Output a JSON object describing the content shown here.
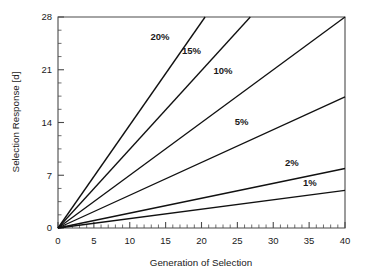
{
  "chart_data": {
    "type": "line",
    "title": "",
    "xlabel": "Generation of Selection",
    "ylabel": "Selection Response [d]",
    "xlim": [
      0,
      40
    ],
    "ylim": [
      0,
      28
    ],
    "grid": false,
    "legend_position": "inline-labels",
    "x_ticks": [
      0,
      5,
      10,
      15,
      20,
      25,
      30,
      35,
      40
    ],
    "x_tick_labels": [
      "0",
      "5",
      "10",
      "15",
      "20",
      "25",
      "30",
      "35",
      "40"
    ],
    "x_minor_tick_step": 1,
    "y_ticks": [
      0,
      7,
      14,
      21,
      28
    ],
    "y_tick_labels": [
      "0",
      "7",
      "14",
      "21",
      "28"
    ],
    "y_minor_tick_step": 1.75,
    "series": [
      {
        "name": "20%",
        "label": "20%",
        "slope": 1.366,
        "x": [
          0,
          20.5
        ],
        "values": [
          0,
          28.0
        ],
        "label_x": 14.2,
        "label_y": 25.0
      },
      {
        "name": "15%",
        "label": "15%",
        "slope": 1.045,
        "x": [
          0,
          26.8
        ],
        "values": [
          0,
          28.0
        ],
        "label_x": 18.6,
        "label_y": 23.1
      },
      {
        "name": "10%",
        "label": "10%",
        "slope": 0.7,
        "x": [
          0,
          40
        ],
        "values": [
          0,
          28.0
        ],
        "label_x": 23.0,
        "label_y": 20.4
      },
      {
        "name": "5%",
        "label": "5%",
        "slope": 0.435,
        "x": [
          0,
          40
        ],
        "values": [
          0,
          17.4
        ],
        "label_x": 25.6,
        "label_y": 13.7
      },
      {
        "name": "2%",
        "label": "2%",
        "slope": 0.1975,
        "x": [
          0,
          40
        ],
        "values": [
          0,
          7.9
        ],
        "label_x": 32.6,
        "label_y": 8.2
      },
      {
        "name": "1%",
        "label": "1%",
        "slope": 0.125,
        "x": [
          0,
          40
        ],
        "values": [
          0,
          5.0
        ],
        "label_x": 35.1,
        "label_y": 5.6
      }
    ]
  },
  "axes": {
    "x_title": "Generation of Selection",
    "y_title": "Selection Response [d]"
  }
}
